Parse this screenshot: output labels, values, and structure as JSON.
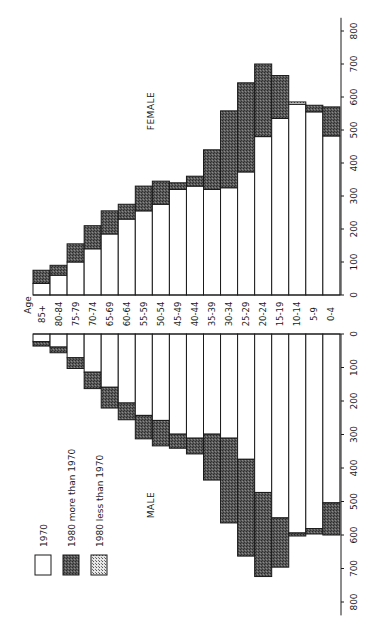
{
  "chart_data": {
    "type": "bar",
    "subtype": "population-pyramid (rotated 90deg counter-clockwise)",
    "title": "",
    "xlabel": "Age",
    "ylabel": "",
    "ylim": [
      0,
      800
    ],
    "y_ticks": [
      0,
      100,
      200,
      300,
      400,
      500,
      600,
      700,
      800
    ],
    "grid": false,
    "legend_position": "lower-left",
    "legend": [
      {
        "key": "1970",
        "label": "1970",
        "fill": "white"
      },
      {
        "key": "more",
        "label": "1980 more than 1970",
        "fill": "dark-stipple"
      },
      {
        "key": "less",
        "label": "1980 less than 1970",
        "fill": "light-crosshatch"
      }
    ],
    "annotations": [
      "FEMALE",
      "MALE"
    ],
    "categories": [
      "85+",
      "80-84",
      "75-79",
      "70-74",
      "65-69",
      "60-64",
      "55-59",
      "50-54",
      "45-49",
      "40-44",
      "35-39",
      "30-34",
      "25-29",
      "20-24",
      "15-19",
      "10-14",
      "5-9",
      "0-4"
    ],
    "series": [
      {
        "name": "Female 1970",
        "values": [
          35,
          60,
          100,
          140,
          185,
          230,
          255,
          275,
          320,
          330,
          320,
          325,
          373,
          480,
          535,
          585,
          555,
          482
        ]
      },
      {
        "name": "Female 1980",
        "values": [
          75,
          90,
          155,
          210,
          255,
          275,
          330,
          345,
          340,
          360,
          440,
          558,
          643,
          700,
          665,
          578,
          575,
          570
        ]
      },
      {
        "name": "Male 1970",
        "values": [
          23,
          39,
          71,
          114,
          159,
          206,
          243,
          258,
          299,
          311,
          299,
          311,
          374,
          473,
          549,
          594,
          581,
          504
        ]
      },
      {
        "name": "Male 1980",
        "values": [
          36,
          56,
          103,
          163,
          221,
          256,
          313,
          334,
          341,
          358,
          436,
          564,
          663,
          724,
          696,
          603,
          597,
          600
        ]
      }
    ]
  },
  "labels": {
    "age_header": "Age",
    "female": "FEMALE",
    "male": "MALE",
    "legend_1970": "1970",
    "legend_more": "1980 more than 1970",
    "legend_less": "1980 less than 1970"
  }
}
